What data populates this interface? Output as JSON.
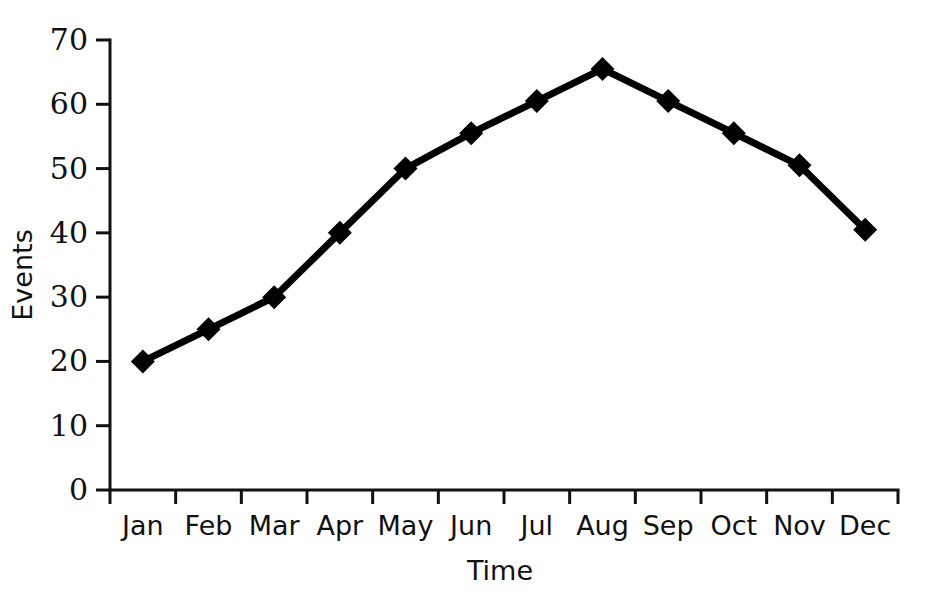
{
  "chart_data": {
    "type": "line",
    "title": "",
    "subtitle": "",
    "xlabel": "Time",
    "ylabel": "Events",
    "categories": [
      "Jan",
      "Feb",
      "Mar",
      "Apr",
      "May",
      "Jun",
      "Jul",
      "Aug",
      "Sep",
      "Oct",
      "Nov",
      "Dec"
    ],
    "series": [
      {
        "name": "Events",
        "values": [
          20,
          25,
          30,
          40,
          50,
          55.5,
          60.5,
          65.5,
          60.5,
          55.5,
          50.5,
          40.5
        ],
        "color": "#000000",
        "marker": "diamond",
        "line_width": 7
      }
    ],
    "ylim": [
      0,
      70
    ],
    "yticks": [
      0,
      10,
      20,
      30,
      40,
      50,
      60,
      70
    ],
    "ytick_labels": [
      "0",
      "10",
      "20",
      "30",
      "40",
      "50",
      "60",
      "70"
    ],
    "xtick_style": "category-boundaries",
    "grid": false,
    "legend": false,
    "legend_position": "none",
    "background_color": "#ffffff",
    "axis_color": "#111111"
  },
  "axes": {
    "y_title": "Events",
    "x_title": "Time"
  }
}
